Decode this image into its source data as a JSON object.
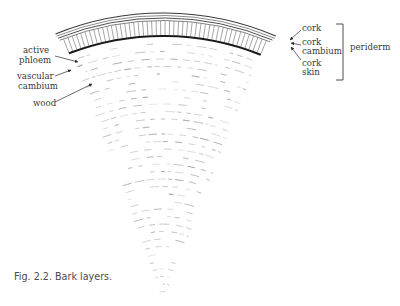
{
  "figure": {
    "caption": "Fig. 2.2. Bark layers.",
    "labels_left": {
      "active_phloem": [
        "active",
        "phloem"
      ],
      "vascular_cambium": [
        "vascular",
        "cambium"
      ],
      "wood": "wood"
    },
    "labels_right": {
      "cork": "cork",
      "cork_cambium": [
        "cork",
        "cambium"
      ],
      "cork_skin": [
        "cork",
        "skin"
      ],
      "bracket_label": "periderm"
    },
    "colors": {
      "ink": "#3a3a3a",
      "cambium_line": "#1a1a1a",
      "wood_dashes": "#9a9a9a",
      "background": "#ffffff"
    }
  }
}
